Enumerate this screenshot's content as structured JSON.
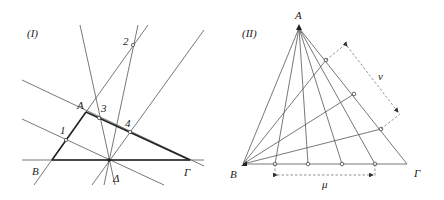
{
  "figure1": {
    "label": "(I)",
    "vertices": {
      "A": "A",
      "B": "B",
      "G": "Γ",
      "D": "Δ"
    },
    "points": [
      "1",
      "2",
      "3",
      "4"
    ]
  },
  "figure2": {
    "label": "(II)",
    "vertices": {
      "A": "A",
      "B": "B",
      "G": "Γ"
    },
    "nu": "ν",
    "mu": "μ"
  }
}
